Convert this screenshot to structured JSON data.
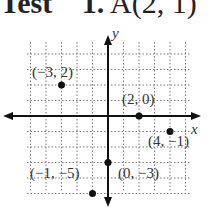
{
  "header": {
    "word": "Test",
    "problem": "1.",
    "point_label": "A(2, 1)"
  },
  "chart_data": {
    "type": "scatter",
    "title": "",
    "xlabel": "x",
    "ylabel": "y",
    "grid": true,
    "xlim": [
      -5,
      3
    ],
    "ylim": [
      -5,
      5
    ],
    "points": [
      {
        "label": "(−3, 2)",
        "x": -3,
        "y": 2
      },
      {
        "label": "(2, 0)",
        "x": 2,
        "y": 0
      },
      {
        "label": "(4, −1)",
        "x": 4,
        "y": -1
      },
      {
        "label": "(0, −3)",
        "x": 0,
        "y": -3
      },
      {
        "label": "(−1, −5)",
        "x": -1,
        "y": -5
      }
    ]
  }
}
